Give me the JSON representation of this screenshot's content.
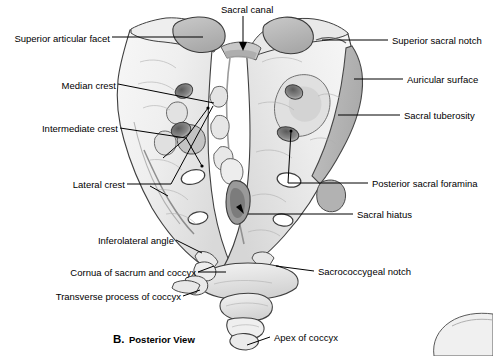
{
  "figure": {
    "caption_letter": "B.",
    "caption_text": "Posterior View",
    "background_color": "#ffffff",
    "bone_fill_light": "#f2f2f2",
    "bone_fill_mid": "#dcdcdc",
    "bone_fill_dark": "#b6b6b6",
    "outline_color": "#3a3a3a",
    "leader_color": "#000000",
    "text_color": "#000000"
  },
  "labels_left": [
    {
      "id": "superior-articular-facet",
      "text": "Superior articular facet",
      "x": 8,
      "y": 33
    },
    {
      "id": "median-crest",
      "text": "Median crest",
      "x": 52,
      "y": 80
    },
    {
      "id": "intermediate-crest",
      "text": "Intermediate crest",
      "x": 34,
      "y": 123
    },
    {
      "id": "lateral-crest",
      "text": "Lateral crest",
      "x": 57,
      "y": 179
    },
    {
      "id": "inferolateral-angle",
      "text": "Inferolateral angle",
      "x": 76,
      "y": 235
    },
    {
      "id": "cornua-of-sacrum-and-coccyx",
      "text": "Cornua of sacrum and coccyx",
      "x": 61,
      "y": 268
    },
    {
      "id": "transverse-process-of-coccyx",
      "text": "Transverse process of coccyx",
      "x": 71,
      "y": 292
    }
  ],
  "labels_right": [
    {
      "id": "superior-sacral-notch",
      "text": "Superior sacral notch",
      "x": 394,
      "y": 35
    },
    {
      "id": "auricular-surface",
      "text": "Auricular surface",
      "x": 409,
      "y": 74
    },
    {
      "id": "sacral-tuberosity",
      "text": "Sacral tuberosity",
      "x": 406,
      "y": 110
    },
    {
      "id": "posterior-sacral-foramina",
      "text": "Posterior sacral foramina",
      "x": 373,
      "y": 178
    },
    {
      "id": "sacral-hiatus",
      "text": "Sacral hiatus",
      "x": 359,
      "y": 209
    },
    {
      "id": "sacrococcygeal-notch",
      "text": "Sacrococcygeal notch",
      "x": 320,
      "y": 267
    },
    {
      "id": "apex-of-coccyx",
      "text": "Apex of coccyx",
      "x": 275,
      "y": 333
    }
  ],
  "labels_top": [
    {
      "id": "sacral-canal",
      "text": "Sacral canal",
      "x": 221,
      "y": 4
    }
  ]
}
